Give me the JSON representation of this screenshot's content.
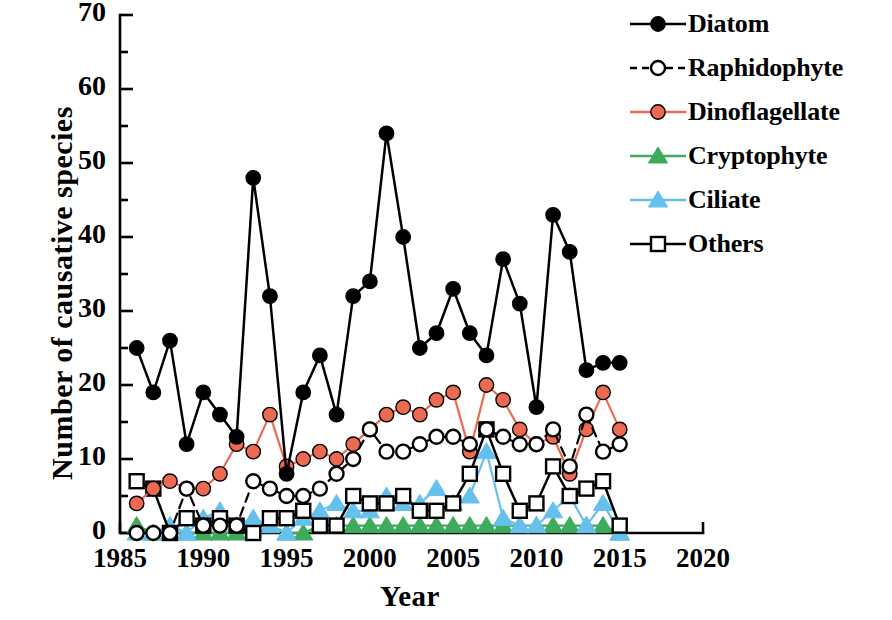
{
  "chart_data": {
    "type": "line",
    "title": "",
    "xlabel": "Year",
    "ylabel": "Number of causative species",
    "xlim": [
      1985,
      2020
    ],
    "ylim": [
      0,
      70
    ],
    "xticks": [
      1985,
      1990,
      1995,
      2000,
      2005,
      2010,
      2015,
      2020
    ],
    "yticks": [
      0,
      10,
      20,
      30,
      40,
      50,
      60,
      70
    ],
    "grid": false,
    "legend_position": "top-right",
    "x": [
      1986,
      1987,
      1988,
      1989,
      1990,
      1991,
      1992,
      1993,
      1994,
      1995,
      1996,
      1997,
      1998,
      1999,
      2000,
      2001,
      2002,
      2003,
      2004,
      2005,
      2006,
      2007,
      2008,
      2009,
      2010,
      2011,
      2012,
      2013,
      2014,
      2015
    ],
    "series": [
      {
        "name": "Diatom",
        "color": "#000000",
        "line": "solid",
        "marker": "filled-circle",
        "values": [
          25,
          19,
          26,
          12,
          19,
          16,
          13,
          48,
          32,
          8,
          19,
          24,
          16,
          32,
          34,
          54,
          40,
          25,
          27,
          33,
          27,
          24,
          37,
          31,
          17,
          43,
          38,
          22,
          23,
          23
        ]
      },
      {
        "name": "Raphidophyte",
        "color": "#000000",
        "line": "dashed",
        "marker": "open-circle",
        "values": [
          0,
          0,
          0,
          6,
          1,
          1,
          1,
          7,
          6,
          5,
          5,
          6,
          8,
          10,
          14,
          11,
          11,
          12,
          13,
          13,
          12,
          14,
          13,
          12,
          12,
          14,
          9,
          16,
          11,
          12
        ]
      },
      {
        "name": "Dinoflagellate",
        "color": "#ec6a52",
        "line": "solid",
        "marker": "filled-circle",
        "values": [
          4,
          6,
          7,
          6,
          6,
          8,
          12,
          11,
          16,
          9,
          10,
          11,
          10,
          12,
          14,
          16,
          17,
          16,
          18,
          19,
          11,
          20,
          18,
          14,
          12,
          13,
          8,
          14,
          19,
          14
        ]
      },
      {
        "name": "Cryptophyte",
        "color": "#3eab5c",
        "line": "solid",
        "marker": "filled-triangle",
        "values": [
          1,
          0,
          0,
          0,
          0,
          0,
          0,
          1,
          1,
          0,
          0,
          1,
          1,
          1,
          1,
          1,
          1,
          1,
          1,
          1,
          1,
          1,
          1,
          1,
          1,
          1,
          1,
          1,
          1,
          0
        ]
      },
      {
        "name": "Ciliate",
        "color": "#66c0ed",
        "line": "solid",
        "marker": "filled-triangle",
        "values": [
          0,
          0,
          1,
          0,
          2,
          3,
          1,
          2,
          1,
          0,
          2,
          3,
          4,
          3,
          3,
          5,
          4,
          4,
          6,
          4,
          5,
          11,
          2,
          1,
          1,
          3,
          5,
          1,
          4,
          0
        ]
      },
      {
        "name": "Others",
        "color": "#000000",
        "line": "solid",
        "marker": "open-square",
        "values": [
          7,
          6,
          0,
          2,
          1,
          2,
          1,
          0,
          2,
          2,
          3,
          1,
          1,
          5,
          4,
          4,
          5,
          3,
          3,
          4,
          8,
          14,
          8,
          3,
          4,
          9,
          5,
          6,
          7,
          1
        ]
      }
    ]
  },
  "axes": {
    "ylabel": "Number of causative species",
    "xlabel": "Year",
    "ytick_labels": [
      "70",
      "60",
      "50",
      "40",
      "30",
      "20",
      "10",
      "0"
    ],
    "xtick_labels": [
      "1985",
      "1990",
      "1995",
      "2000",
      "2005",
      "2010",
      "2015",
      "2020"
    ]
  },
  "legend": {
    "items": [
      {
        "label": "Diatom",
        "icon": "line-filled-circle-icon"
      },
      {
        "label": "Raphidophyte",
        "icon": "dashed-line-open-circle-icon"
      },
      {
        "label": "Dinoflagellate",
        "icon": "line-filled-circle-red-icon"
      },
      {
        "label": "Cryptophyte",
        "icon": "line-filled-triangle-green-icon"
      },
      {
        "label": "Ciliate",
        "icon": "line-filled-triangle-blue-icon"
      },
      {
        "label": "Others",
        "icon": "line-open-square-icon"
      }
    ]
  }
}
